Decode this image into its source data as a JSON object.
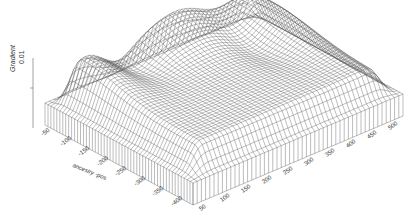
{
  "chart_data": {
    "type": "surface3d",
    "title": "",
    "zlabel": "Gradient",
    "z_ticks": [
      "0.01"
    ],
    "y_axis": {
      "label": "ancestry -pos",
      "ticks": [
        "-50",
        "-100",
        "-150",
        "-200",
        "-250",
        "-300",
        "-350",
        "-400"
      ]
    },
    "x_axis": {
      "label": "",
      "ticks": [
        "50",
        "100",
        "150",
        "200",
        "250",
        "300",
        "350",
        "400",
        "450",
        "500"
      ]
    },
    "surface_description": "Wireframe surface on a plateau with vertical skirt; broad peak toward back center, two ridges extending toward left and right back edges, dark troughs (steep gradients) near the ridges.",
    "features": [
      {
        "name": "peak",
        "x": 250,
        "y": -50,
        "z": 0.02
      },
      {
        "name": "left-ridge",
        "x": 100,
        "y": -50,
        "z": 0.015
      },
      {
        "name": "right-ridge",
        "x": 450,
        "y": -100,
        "z": 0.015
      },
      {
        "name": "plateau",
        "z": 0.005
      }
    ],
    "grid": false,
    "legend": null
  }
}
